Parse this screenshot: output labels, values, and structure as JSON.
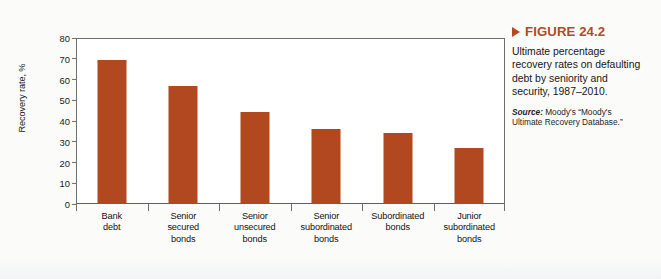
{
  "figure": {
    "label": "FIGURE 24.2",
    "marker_icon": "triangle-right-icon",
    "caption": "Ultimate percentage recovery rates on defaulting debt by seniority and security, 1987–2010.",
    "source_word": "Source:",
    "source_text": " Moody's “Moody's Ultimate Recovery Database.”"
  },
  "chart_data": {
    "type": "bar",
    "title": "",
    "xlabel": "",
    "ylabel": "Recovery rate, %",
    "ylim": [
      0,
      80
    ],
    "yticks": [
      0,
      10,
      20,
      30,
      40,
      50,
      60,
      70,
      80
    ],
    "ytick_labels": [
      "0",
      "10",
      "20",
      "30",
      "40",
      "50",
      "60",
      "70",
      "80"
    ],
    "grid": false,
    "legend": "none",
    "bar_color": "#b2481f",
    "categories": [
      "Bank debt",
      "Senior secured bonds",
      "Senior unsecured bonds",
      "Senior subordinated bonds",
      "Subordinated bonds",
      "Junior subordinated bonds"
    ],
    "category_lines": [
      [
        "Bank",
        "debt"
      ],
      [
        "Senior",
        "secured",
        "bonds"
      ],
      [
        "Senior",
        "unsecured",
        "bonds"
      ],
      [
        "Senior",
        "subordinated",
        "bonds"
      ],
      [
        "Subordinated",
        "bonds"
      ],
      [
        "Junior",
        "subordinated",
        "bonds"
      ]
    ],
    "values": [
      69.5,
      57,
      44.5,
      36,
      34.3,
      27
    ]
  }
}
